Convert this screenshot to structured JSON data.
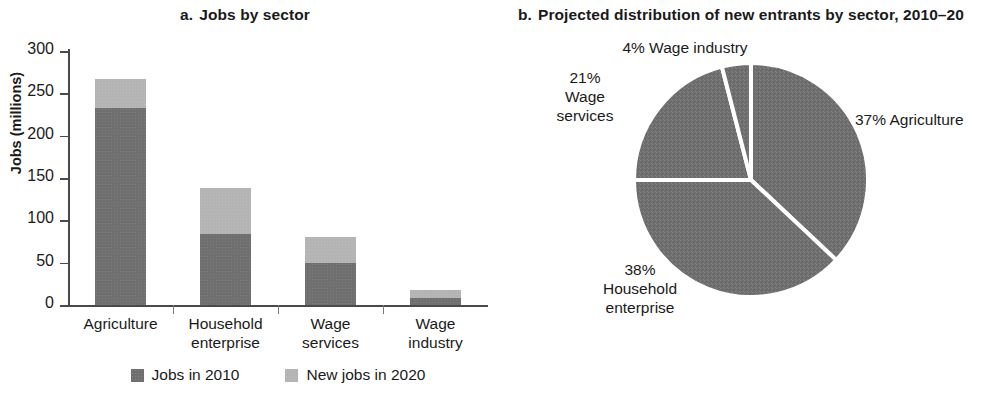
{
  "panel_a": {
    "marker": "a.",
    "title": "Jobs by sector",
    "ylabel": "Jobs (millions)",
    "legend": [
      {
        "label": "Jobs in 2010",
        "color": "#6f6f6f"
      },
      {
        "label": "New jobs in 2020",
        "color": "#b4b4b4"
      }
    ]
  },
  "panel_b": {
    "marker": "b.",
    "title": "Projected distribution of new entrants by sector, 2010–20",
    "labels": {
      "wage_industry": "4% Wage industry",
      "wage_services_pct": "21%",
      "wage_services_l1": "Wage",
      "wage_services_l2": "services",
      "agriculture": "37% Agriculture",
      "household_pct": "38%",
      "household_l1": "Household",
      "household_l2": "enterprise"
    }
  },
  "chart_data": [
    {
      "type": "bar",
      "subtype": "stacked",
      "title": "a. Jobs by sector",
      "xlabel": "",
      "ylabel": "Jobs (millions)",
      "ylim": [
        0,
        300
      ],
      "yticks": [
        0,
        50,
        100,
        150,
        200,
        250,
        300
      ],
      "ytick_labels": [
        "0",
        "50",
        "100",
        "150",
        "200",
        "250",
        "300"
      ],
      "grid": false,
      "legend_position": "bottom",
      "categories": [
        "Agriculture",
        "Household enterprise",
        "Wage services",
        "Wage industry"
      ],
      "category_lines": [
        [
          "Agriculture"
        ],
        [
          "Household",
          "enterprise"
        ],
        [
          "Wage",
          "services"
        ],
        [
          "Wage",
          "industry"
        ]
      ],
      "series": [
        {
          "name": "Jobs in 2010",
          "color": "#6f6f6f",
          "values": [
            233,
            84,
            50,
            8
          ]
        },
        {
          "name": "New jobs in 2020",
          "color": "#b4b4b4",
          "values": [
            34,
            54,
            30,
            10
          ]
        }
      ],
      "totals": [
        267,
        138,
        80,
        18
      ]
    },
    {
      "type": "pie",
      "title": "b. Projected distribution of new entrants by sector, 2010–20",
      "start_angle_deg": 0,
      "direction": "clockwise",
      "slice_color": "#6f6f6f",
      "separator_color": "#ffffff",
      "labels": [
        "Agriculture",
        "Household enterprise",
        "Wage services",
        "Wage industry"
      ],
      "values": [
        37,
        38,
        21,
        4
      ],
      "units": "percent",
      "annotations": [
        "37% Agriculture",
        "38% Household enterprise",
        "21% Wage services",
        "4% Wage industry"
      ]
    }
  ]
}
